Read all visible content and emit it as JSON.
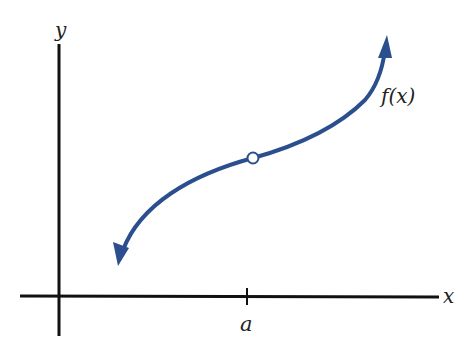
{
  "diagram": {
    "type": "function graph with removable discontinuity",
    "axes": {
      "x_label": "x",
      "y_label": "y"
    },
    "tick": {
      "label": "a"
    },
    "curve": {
      "label": "f(x)",
      "color": "#2b4f8e"
    },
    "open_point": {
      "description": "open circle at x = a",
      "fill": "#ffffff"
    },
    "colors": {
      "axes": "#111111",
      "curve": "#2b4f8e",
      "background": "#ffffff"
    }
  }
}
